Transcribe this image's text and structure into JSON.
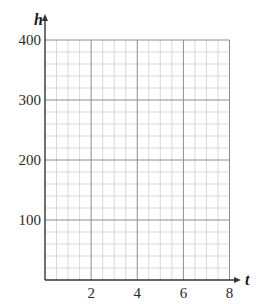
{
  "chart_data": {
    "type": "line",
    "title": "",
    "xlabel": "t",
    "ylabel": "h",
    "xlim": [
      0,
      8
    ],
    "ylim": [
      0,
      400
    ],
    "x_ticks": [
      2,
      4,
      6,
      8
    ],
    "x_tick_labels": [
      "2",
      "4",
      "6",
      "8"
    ],
    "y_ticks": [
      100,
      200,
      300,
      400
    ],
    "y_tick_labels": [
      "100",
      "200",
      "300",
      "400"
    ],
    "grid": true,
    "grid_major_x_step": 2,
    "grid_minor_x_step": 0.5,
    "grid_major_y_step": 100,
    "grid_minor_y_step": 20,
    "series": [],
    "legend": null
  },
  "colors": {
    "axis": "#333333",
    "major_grid": "#8c8c8c",
    "minor_grid": "#cfcfcf"
  }
}
